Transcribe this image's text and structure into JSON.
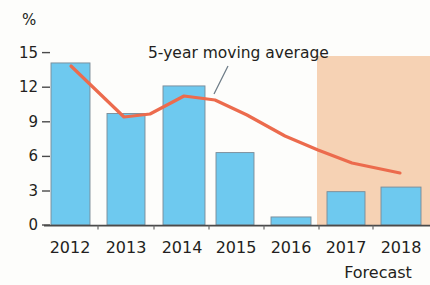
{
  "chart_data": {
    "type": "bar",
    "title": "",
    "subtitle": "",
    "xlabel": "",
    "ylabel": "%",
    "ylim": [
      0,
      15
    ],
    "yticks": [
      0,
      3,
      6,
      9,
      12,
      15
    ],
    "ytick_labels": [
      "0",
      "3",
      "6",
      "9",
      "12",
      "15"
    ],
    "grid": false,
    "legend_position": "none",
    "categories": [
      "2012",
      "2013",
      "2014",
      "2015",
      "2016",
      "2017",
      "2018"
    ],
    "series": [
      {
        "name": "Annual value",
        "type": "bar",
        "color": "#6ec9ef",
        "edge_color": "#7a8a96",
        "values": [
          14.1,
          9.7,
          12.1,
          6.3,
          0.7,
          2.9,
          3.3
        ]
      },
      {
        "name": "5-year moving average",
        "type": "line",
        "color": "#ec6b4d",
        "x": [
          "2012",
          "2013",
          "2014",
          "2015",
          "2016",
          "2017",
          "2018"
        ],
        "values": [
          13.8,
          9.3,
          11.2,
          10.6,
          8.4,
          6.3,
          4.6
        ]
      }
    ],
    "annotations": [
      {
        "name": "moving-average-callout",
        "text": "5-year moving average",
        "target_series": "5-year moving average"
      },
      {
        "name": "forecast-region-label",
        "text": "Forecast",
        "shaded_from": "2017",
        "shaded_to": "2018",
        "shade_color": "#f6d2b4"
      }
    ]
  },
  "axes": {
    "y_unit_label": "%",
    "y_ticks": [
      "15",
      "12",
      "9",
      "6",
      "3",
      "0"
    ],
    "x_ticks": [
      "2012",
      "2013",
      "2014",
      "2015",
      "2016",
      "2017",
      "2018"
    ]
  },
  "annotations": {
    "moving_average_label": "5-year moving average",
    "forecast_label": "Forecast"
  },
  "colors": {
    "bar_fill": "#6ec9ef",
    "bar_stroke": "#8f9ba3",
    "line": "#ec6b4d",
    "forecast_band": "#f6d2b4",
    "axis": "#4a4a4a",
    "text": "#231f20",
    "background": "#fdfdfb"
  }
}
